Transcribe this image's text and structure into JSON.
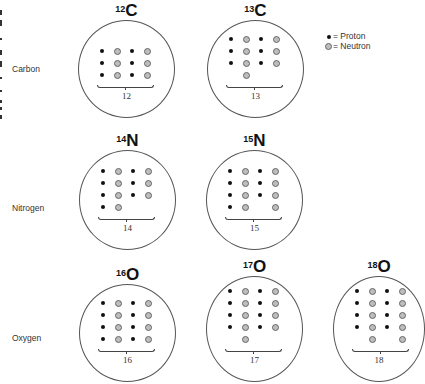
{
  "legend": {
    "proton_label": "= Proton",
    "neutron_label": "= Neutron"
  },
  "colors": {
    "proton": "#111111",
    "neutron_fill": "#bdbdbd",
    "neutron_stroke": "#666666",
    "ring": "#555555"
  },
  "rows": [
    {
      "label": "Carbon"
    },
    {
      "label": "Nitrogen"
    },
    {
      "label": "Oxygen"
    }
  ],
  "isotopes": [
    {
      "mass": "12",
      "symbol": "C",
      "element": "Carbon",
      "protons": 6,
      "neutrons": 6,
      "mass_label": "12",
      "grid": [
        [
          "p",
          "n",
          "p",
          "n"
        ],
        [
          "p",
          "n",
          "p",
          "n"
        ],
        [
          "p",
          "n",
          "p",
          "n"
        ]
      ]
    },
    {
      "mass": "13",
      "symbol": "C",
      "element": "Carbon",
      "protons": 6,
      "neutrons": 7,
      "mass_label": "13",
      "grid": [
        [
          "p",
          "n",
          "p",
          "n"
        ],
        [
          "p",
          "n",
          "p",
          "n"
        ],
        [
          "p",
          "n",
          "p",
          "n"
        ],
        [
          "",
          "n",
          "",
          ""
        ]
      ]
    },
    {
      "mass": "14",
      "symbol": "N",
      "element": "Nitrogen",
      "protons": 7,
      "neutrons": 7,
      "mass_label": "14",
      "grid": [
        [
          "p",
          "n",
          "p",
          "n"
        ],
        [
          "p",
          "n",
          "p",
          "n"
        ],
        [
          "p",
          "n",
          "p",
          "n"
        ],
        [
          "p",
          "n",
          "",
          ""
        ]
      ]
    },
    {
      "mass": "15",
      "symbol": "N",
      "element": "Nitrogen",
      "protons": 7,
      "neutrons": 8,
      "mass_label": "15",
      "grid": [
        [
          "p",
          "n",
          "p",
          "n"
        ],
        [
          "p",
          "n",
          "p",
          "n"
        ],
        [
          "p",
          "n",
          "p",
          "n"
        ],
        [
          "p",
          "n",
          "",
          "n"
        ]
      ]
    },
    {
      "mass": "16",
      "symbol": "O",
      "element": "Oxygen",
      "protons": 8,
      "neutrons": 8,
      "mass_label": "16",
      "grid": [
        [
          "p",
          "n",
          "p",
          "n"
        ],
        [
          "p",
          "n",
          "p",
          "n"
        ],
        [
          "p",
          "n",
          "p",
          "n"
        ],
        [
          "p",
          "n",
          "p",
          "n"
        ]
      ]
    },
    {
      "mass": "17",
      "symbol": "O",
      "element": "Oxygen",
      "protons": 8,
      "neutrons": 9,
      "mass_label": "17",
      "grid": [
        [
          "p",
          "n",
          "p",
          "n"
        ],
        [
          "p",
          "n",
          "p",
          "n"
        ],
        [
          "p",
          "n",
          "p",
          "n"
        ],
        [
          "p",
          "n",
          "p",
          "n"
        ],
        [
          "",
          "n",
          "",
          ""
        ]
      ]
    },
    {
      "mass": "18",
      "symbol": "O",
      "element": "Oxygen",
      "protons": 8,
      "neutrons": 10,
      "mass_label": "18",
      "grid": [
        [
          "p",
          "n",
          "p",
          "n"
        ],
        [
          "p",
          "n",
          "p",
          "n"
        ],
        [
          "p",
          "n",
          "p",
          "n"
        ],
        [
          "p",
          "n",
          "p",
          "n"
        ],
        [
          "",
          "n",
          "",
          "n"
        ]
      ]
    }
  ]
}
